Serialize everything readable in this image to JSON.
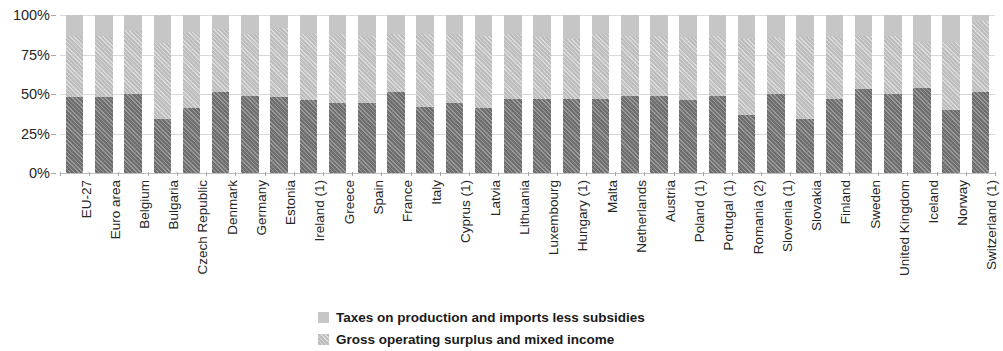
{
  "chart_data": {
    "type": "bar",
    "subtype": "stacked-percentage",
    "title": "",
    "xlabel": "",
    "ylabel": "",
    "ylim": [
      0,
      100
    ],
    "ytick_labels": [
      "0%",
      "25%",
      "50%",
      "75%",
      "100%"
    ],
    "ytick_values": [
      0,
      25,
      50,
      75,
      100
    ],
    "grid": true,
    "legend_position": "bottom",
    "categories": [
      "EU-27",
      "Euro area",
      "Belgium",
      "Bulgaria",
      "Czech Republic",
      "Denmark",
      "Germany",
      "Estonia",
      "Ireland (1)",
      "Greece",
      "Spain",
      "France",
      "Italy",
      "Cyprus (1)",
      "Latvia",
      "Lithuania",
      "Luxembourg",
      "Hungary (1)",
      "Malta",
      "Netherlands",
      "Austria",
      "Poland (1)",
      "Portugal (1)",
      "Romania (2)",
      "Slovenia (1)",
      "Slovakia",
      "Finland",
      "Sweden",
      "United Kingdom",
      "Iceland",
      "Norway",
      "Switzerland (1)"
    ],
    "series": [
      {
        "name": "Compensation of employees",
        "values": [
          48,
          48,
          50,
          34,
          41,
          51,
          49,
          48,
          46,
          44,
          44,
          51,
          42,
          44,
          41,
          47,
          47,
          47,
          47,
          49,
          49,
          46,
          49,
          37,
          50,
          34,
          47,
          53,
          50,
          54,
          40,
          51
        ]
      },
      {
        "name": "Gross operating surplus and mixed income",
        "values": [
          39,
          39,
          40,
          48,
          48,
          40,
          39,
          44,
          42,
          44,
          43,
          37,
          46,
          44,
          46,
          41,
          39,
          38,
          41,
          38,
          38,
          40,
          38,
          48,
          36,
          52,
          40,
          34,
          37,
          29,
          43,
          45
        ]
      },
      {
        "name": "Taxes on production and imports less subsidies",
        "values": [
          13,
          13,
          10,
          18,
          11,
          9,
          12,
          8,
          12,
          12,
          13,
          12,
          12,
          12,
          13,
          12,
          14,
          15,
          12,
          13,
          13,
          14,
          13,
          15,
          14,
          14,
          13,
          13,
          13,
          17,
          17,
          4
        ]
      }
    ],
    "colors": {
      "compensation_of_employees": "#6e6e6e",
      "gross_operating_surplus": "#bdbdbd",
      "taxes_on_production": "#c6c6c6",
      "gridline": "#d9d9d9",
      "text": "#262626"
    }
  },
  "legend": {
    "entries": [
      {
        "label": "Taxes on production and imports less subsidies",
        "swatch": "sw-tax"
      },
      {
        "label": "Gross operating surplus and mixed income",
        "swatch": "sw-gos"
      }
    ]
  }
}
